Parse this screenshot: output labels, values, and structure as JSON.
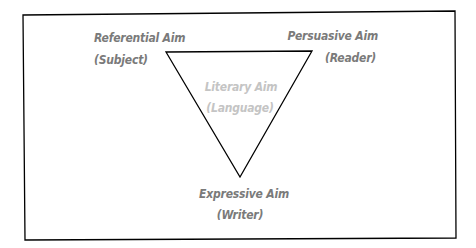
{
  "diagram": {
    "type": "communication-triangle",
    "nodes": [
      {
        "id": "referential",
        "title": "Referential Aim",
        "subtitle": "(Subject)",
        "position": "top-left"
      },
      {
        "id": "persuasive",
        "title": "Persuasive Aim",
        "subtitle": "(Reader)",
        "position": "top-right"
      },
      {
        "id": "literary",
        "title": "Literary Aim",
        "subtitle": "(Language)",
        "position": "center"
      },
      {
        "id": "expressive",
        "title": "Expressive Aim",
        "subtitle": "(Writer)",
        "position": "bottom"
      }
    ],
    "colors": {
      "label": "#7a7a7a",
      "center_label": "#c4c4c4",
      "stroke": "#000000",
      "background": "#ffffff"
    }
  }
}
